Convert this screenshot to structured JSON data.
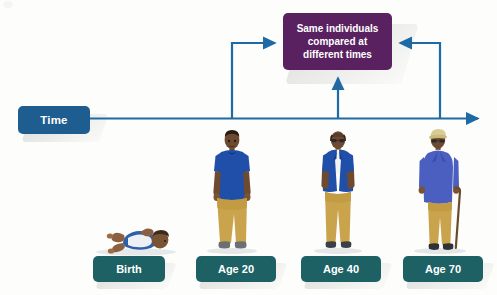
{
  "diagram": {
    "title_box": {
      "label": "Time",
      "color": "#1d5d8f"
    },
    "callout": {
      "line1": "Same individuals",
      "line2": "compared at",
      "line3": "different times",
      "full_text": "Same individuals compared at different times",
      "color": "#59215f"
    },
    "timeline": {
      "color": "#1f6aa5",
      "direction": "left-to-right",
      "arrow_icon": "arrow-right-icon"
    },
    "stages": [
      {
        "label": "Birth",
        "figure": "infant-lying-icon",
        "has_connector": false,
        "color": "#1d6164"
      },
      {
        "label": "Age 20",
        "figure": "young-adult-standing-icon",
        "has_connector": true,
        "connector": "elbow-up-right-to-callout",
        "color": "#1d6164"
      },
      {
        "label": "Age 40",
        "figure": "middle-aged-adult-standing-icon",
        "has_connector": true,
        "connector": "straight-up-to-callout",
        "color": "#1d6164"
      },
      {
        "label": "Age 70",
        "figure": "elderly-adult-with-cane-icon",
        "has_connector": true,
        "connector": "elbow-up-left-to-callout",
        "color": "#1d6164"
      }
    ],
    "palette": {
      "timeline_blue": "#1f6aa5",
      "time_box_blue": "#1d5d8f",
      "age_box_teal": "#1d6164",
      "callout_purple": "#59215f",
      "shirt_blue": "#1f4fa8",
      "pants_khaki": "#c9a44c",
      "skin_dark": "#6b4b32",
      "background": "#fdfdfc"
    }
  }
}
